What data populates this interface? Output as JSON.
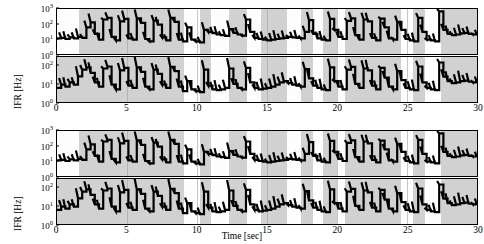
{
  "figure": {
    "ylabel": "IFR [Hz]",
    "xlabel": "Time [sec]",
    "panel_count": 4
  },
  "chart_data": {
    "type": "line",
    "title": "",
    "xlabel": "Time [sec]",
    "ylabel": "IFR [Hz]",
    "xlim": [
      0,
      30
    ],
    "xticks": [
      0,
      5,
      10,
      15,
      20,
      25,
      30
    ],
    "xticklabels": [
      "0",
      "5",
      "10",
      "15",
      "20",
      "25",
      "30"
    ],
    "yscale": "log",
    "grid": false,
    "legend": "none",
    "panels": [
      {
        "index": 0,
        "group": "top",
        "position": "upper",
        "ylim": [
          1,
          1000
        ],
        "yticks": [
          1,
          10,
          100,
          1000
        ],
        "yticklabels": [
          "10^0",
          "10^1",
          "10^2",
          "10^3"
        ],
        "shaded_spans": [
          [
            1.6,
            9.1
          ],
          [
            10.2,
            11.0
          ],
          [
            12.3,
            13.6
          ],
          [
            14.6,
            16.4
          ],
          [
            17.4,
            18.3
          ],
          [
            19.0,
            20.0
          ],
          [
            20.6,
            24.6
          ],
          [
            25.4,
            26.3
          ],
          [
            27.4,
            30.0
          ]
        ],
        "x": [
          0.0,
          0.3,
          0.6,
          0.9,
          1.2,
          1.5,
          1.8,
          2.1,
          2.4,
          2.7,
          3.0,
          3.3,
          3.6,
          3.9,
          4.2,
          4.5,
          4.8,
          5.1,
          5.4,
          5.7,
          6.0,
          6.3,
          6.6,
          6.9,
          7.2,
          7.5,
          7.8,
          8.1,
          8.4,
          8.7,
          9.0,
          9.3,
          9.6,
          9.9,
          10.2,
          10.5,
          10.8,
          11.1,
          11.4,
          11.7,
          12.0,
          12.3,
          12.6,
          12.9,
          13.2,
          13.5,
          13.8,
          14.1,
          14.4,
          14.7,
          15.0,
          15.3,
          15.6,
          15.9,
          16.2,
          16.5,
          16.8,
          17.1,
          17.4,
          17.7,
          18.0,
          18.3,
          18.6,
          18.9,
          19.2,
          19.5,
          19.8,
          20.1,
          20.4,
          20.7,
          21.0,
          21.3,
          21.6,
          21.9,
          22.2,
          22.5,
          22.8,
          23.1,
          23.4,
          23.7,
          24.0,
          24.3,
          24.6,
          24.9,
          25.2,
          25.5,
          25.8,
          26.1,
          26.4,
          26.7,
          27.0,
          27.3,
          27.6,
          27.9,
          28.2,
          28.5,
          28.8,
          29.1,
          29.4,
          29.7,
          30.0
        ],
        "y": [
          11,
          12,
          10,
          13,
          11,
          14,
          12,
          60,
          130,
          22,
          9,
          200,
          260,
          14,
          8,
          150,
          220,
          11,
          9,
          240,
          120,
          10,
          7,
          170,
          90,
          13,
          8,
          260,
          140,
          9,
          7,
          60,
          9,
          7,
          6,
          40,
          30,
          25,
          20,
          18,
          16,
          45,
          26,
          20,
          17,
          200,
          30,
          12,
          10,
          9,
          8,
          9,
          10,
          11,
          12,
          14,
          13,
          12,
          11,
          30,
          180,
          22,
          11,
          9,
          8,
          220,
          40,
          14,
          10,
          160,
          240,
          18,
          9,
          200,
          150,
          12,
          8,
          230,
          60,
          11,
          9,
          140,
          40,
          10,
          8,
          7,
          260,
          30,
          9,
          8,
          7,
          700,
          40,
          22,
          18,
          20,
          24,
          26,
          22,
          20,
          18
        ]
      },
      {
        "index": 1,
        "group": "top",
        "position": "lower",
        "ylim": [
          1,
          300
        ],
        "yticks": [
          1,
          10,
          100
        ],
        "yticklabels": [
          "10^0",
          "10^1",
          "10^2"
        ],
        "shaded_spans": [
          [
            0.0,
            9.1
          ],
          [
            10.2,
            11.0
          ],
          [
            12.3,
            13.6
          ],
          [
            14.6,
            16.4
          ],
          [
            17.4,
            18.3
          ],
          [
            19.0,
            20.0
          ],
          [
            20.6,
            24.6
          ],
          [
            25.4,
            26.3
          ],
          [
            27.4,
            30.0
          ]
        ],
        "x": [
          0.0,
          0.3,
          0.6,
          0.9,
          1.2,
          1.5,
          1.8,
          2.1,
          2.4,
          2.7,
          3.0,
          3.3,
          3.6,
          3.9,
          4.2,
          4.5,
          4.8,
          5.1,
          5.4,
          5.7,
          6.0,
          6.3,
          6.6,
          6.9,
          7.2,
          7.5,
          7.8,
          8.1,
          8.4,
          8.7,
          9.0,
          9.3,
          9.6,
          9.9,
          10.2,
          10.5,
          10.8,
          11.1,
          11.4,
          11.7,
          12.0,
          12.3,
          12.6,
          12.9,
          13.2,
          13.5,
          13.8,
          14.1,
          14.4,
          14.7,
          15.0,
          15.3,
          15.6,
          15.9,
          16.2,
          16.5,
          16.8,
          17.1,
          17.4,
          17.7,
          18.0,
          18.3,
          18.6,
          18.9,
          19.2,
          19.5,
          19.8,
          20.1,
          20.4,
          20.7,
          21.0,
          21.3,
          21.6,
          21.9,
          22.2,
          22.5,
          22.8,
          23.1,
          23.4,
          23.7,
          24.0,
          24.3,
          24.6,
          24.9,
          25.2,
          25.5,
          25.8,
          26.1,
          26.4,
          26.7,
          27.0,
          27.3,
          27.6,
          27.9,
          28.2,
          28.5,
          28.8,
          29.1,
          29.4,
          29.7,
          30.0
        ],
        "y": [
          6,
          9,
          7,
          12,
          9,
          26,
          60,
          80,
          40,
          12,
          7,
          70,
          90,
          9,
          5,
          55,
          75,
          8,
          6,
          80,
          45,
          7,
          5,
          60,
          35,
          9,
          6,
          85,
          50,
          7,
          4,
          14,
          5,
          4,
          3.5,
          60,
          8,
          5,
          4.5,
          5,
          6,
          70,
          10,
          6,
          5,
          75,
          12,
          6,
          5,
          5.5,
          6,
          7,
          9,
          12,
          14,
          11,
          9,
          8,
          7,
          65,
          20,
          8,
          6,
          5,
          4.5,
          80,
          14,
          7,
          5,
          60,
          85,
          10,
          6,
          70,
          55,
          8,
          5,
          75,
          22,
          7,
          5,
          50,
          16,
          6,
          5,
          4.5,
          90,
          12,
          6,
          5,
          4.5,
          150,
          25,
          14,
          11,
          12,
          14,
          15,
          13,
          12,
          11
        ]
      },
      {
        "index": 2,
        "group": "bottom",
        "position": "upper",
        "ylim": [
          1,
          1000
        ],
        "yticks": [
          1,
          10,
          100,
          1000
        ],
        "yticklabels": [
          "10^0",
          "10^1",
          "10^2",
          "10^3"
        ],
        "shaded_spans": [
          [
            1.6,
            9.1
          ],
          [
            10.2,
            11.0
          ],
          [
            12.3,
            13.6
          ],
          [
            14.6,
            16.4
          ],
          [
            17.4,
            18.3
          ],
          [
            19.0,
            20.0
          ],
          [
            20.6,
            24.6
          ],
          [
            25.4,
            26.3
          ],
          [
            27.4,
            30.0
          ]
        ],
        "x": [
          0.0,
          0.3,
          0.6,
          0.9,
          1.2,
          1.5,
          1.8,
          2.1,
          2.4,
          2.7,
          3.0,
          3.3,
          3.6,
          3.9,
          4.2,
          4.5,
          4.8,
          5.1,
          5.4,
          5.7,
          6.0,
          6.3,
          6.6,
          6.9,
          7.2,
          7.5,
          7.8,
          8.1,
          8.4,
          8.7,
          9.0,
          9.3,
          9.6,
          9.9,
          10.2,
          10.5,
          10.8,
          11.1,
          11.4,
          11.7,
          12.0,
          12.3,
          12.6,
          12.9,
          13.2,
          13.5,
          13.8,
          14.1,
          14.4,
          14.7,
          15.0,
          15.3,
          15.6,
          15.9,
          16.2,
          16.5,
          16.8,
          17.1,
          17.4,
          17.7,
          18.0,
          18.3,
          18.6,
          18.9,
          19.2,
          19.5,
          19.8,
          20.1,
          20.4,
          20.7,
          21.0,
          21.3,
          21.6,
          21.9,
          22.2,
          22.5,
          22.8,
          23.1,
          23.4,
          23.7,
          24.0,
          24.3,
          24.6,
          24.9,
          25.2,
          25.5,
          25.8,
          26.1,
          26.4,
          26.7,
          27.0,
          27.3,
          27.6,
          27.9,
          28.2,
          28.5,
          28.8,
          29.1,
          29.4,
          29.7,
          30.0
        ],
        "y": [
          11,
          12,
          10,
          13,
          11,
          14,
          12,
          60,
          130,
          22,
          9,
          200,
          260,
          14,
          8,
          150,
          220,
          11,
          9,
          240,
          120,
          10,
          7,
          170,
          90,
          13,
          8,
          260,
          140,
          9,
          7,
          60,
          9,
          7,
          6,
          40,
          30,
          25,
          20,
          18,
          16,
          45,
          26,
          20,
          17,
          200,
          30,
          12,
          10,
          9,
          8,
          9,
          10,
          11,
          12,
          14,
          13,
          12,
          11,
          30,
          180,
          22,
          11,
          9,
          8,
          220,
          40,
          14,
          10,
          160,
          240,
          18,
          9,
          200,
          150,
          12,
          8,
          230,
          60,
          11,
          9,
          140,
          40,
          10,
          8,
          7,
          260,
          30,
          9,
          8,
          7,
          700,
          40,
          22,
          18,
          20,
          24,
          26,
          22,
          20,
          18
        ]
      },
      {
        "index": 3,
        "group": "bottom",
        "position": "lower",
        "ylim": [
          1,
          300
        ],
        "yticks": [
          1,
          10,
          100
        ],
        "yticklabels": [
          "10^0",
          "10^1",
          "10^2"
        ],
        "shaded_spans": [
          [
            0.0,
            9.1
          ],
          [
            10.2,
            11.0
          ],
          [
            12.3,
            13.6
          ],
          [
            14.6,
            16.4
          ],
          [
            17.4,
            18.3
          ],
          [
            19.0,
            20.0
          ],
          [
            20.6,
            24.6
          ],
          [
            25.4,
            26.3
          ],
          [
            27.4,
            30.0
          ]
        ],
        "x": [
          0.0,
          0.3,
          0.6,
          0.9,
          1.2,
          1.5,
          1.8,
          2.1,
          2.4,
          2.7,
          3.0,
          3.3,
          3.6,
          3.9,
          4.2,
          4.5,
          4.8,
          5.1,
          5.4,
          5.7,
          6.0,
          6.3,
          6.6,
          6.9,
          7.2,
          7.5,
          7.8,
          8.1,
          8.4,
          8.7,
          9.0,
          9.3,
          9.6,
          9.9,
          10.2,
          10.5,
          10.8,
          11.1,
          11.4,
          11.7,
          12.0,
          12.3,
          12.6,
          12.9,
          13.2,
          13.5,
          13.8,
          14.1,
          14.4,
          14.7,
          15.0,
          15.3,
          15.6,
          15.9,
          16.2,
          16.5,
          16.8,
          17.1,
          17.4,
          17.7,
          18.0,
          18.3,
          18.6,
          18.9,
          19.2,
          19.5,
          19.8,
          20.1,
          20.4,
          20.7,
          21.0,
          21.3,
          21.6,
          21.9,
          22.2,
          22.5,
          22.8,
          23.1,
          23.4,
          23.7,
          24.0,
          24.3,
          24.6,
          24.9,
          25.2,
          25.5,
          25.8,
          26.1,
          26.4,
          26.7,
          27.0,
          27.3,
          27.6,
          27.9,
          28.2,
          28.5,
          28.8,
          29.1,
          29.4,
          29.7,
          30.0
        ],
        "y": [
          6,
          9,
          7,
          12,
          9,
          26,
          60,
          80,
          40,
          12,
          7,
          70,
          90,
          9,
          5,
          55,
          75,
          8,
          6,
          80,
          45,
          7,
          5,
          60,
          35,
          9,
          6,
          85,
          50,
          7,
          4,
          14,
          5,
          4,
          3.5,
          60,
          8,
          5,
          4.5,
          5,
          6,
          70,
          10,
          6,
          5,
          75,
          12,
          6,
          5,
          5.5,
          6,
          7,
          9,
          12,
          14,
          11,
          9,
          8,
          7,
          65,
          20,
          8,
          6,
          5,
          4.5,
          80,
          14,
          7,
          5,
          60,
          85,
          10,
          6,
          70,
          55,
          8,
          5,
          75,
          22,
          7,
          5,
          50,
          16,
          6,
          5,
          4.5,
          90,
          12,
          6,
          5,
          4.5,
          150,
          25,
          14,
          11,
          12,
          14,
          15,
          13,
          12,
          11
        ]
      }
    ]
  }
}
